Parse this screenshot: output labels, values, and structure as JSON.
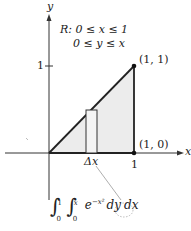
{
  "diagram": {
    "axes": {
      "x_label": "x",
      "y_label": "y",
      "y_tick_label": "1",
      "x_tick_label": "1"
    },
    "region": {
      "name": "R:",
      "line1": "0 ≤ x ≤ 1",
      "line2": "0 ≤ y ≤ x"
    },
    "points": [
      {
        "label": "(1, 1)"
      },
      {
        "label": "(1, 0)"
      }
    ],
    "strip_label": "Δx",
    "integral": {
      "outer_upper": "1",
      "outer_lower": "0",
      "inner_upper": "x",
      "inner_lower": "0",
      "integrand": "e",
      "exponent": "−x²",
      "dy": "dy",
      "dx": "dx"
    },
    "colors": {
      "region_fill": "#ececec",
      "line": "#222222",
      "callout": "#888888"
    }
  }
}
